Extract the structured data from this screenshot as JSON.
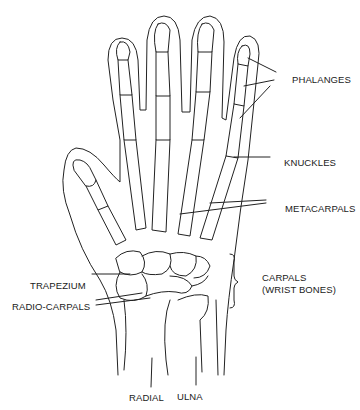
{
  "diagram": {
    "labels": {
      "phalanges": "PHALANGES",
      "knuckles": "KNUCKLES",
      "metacarpals": "METACARPALS",
      "carpals_line1": "CARPALS",
      "carpals_line2": "(WRIST BONES)",
      "trapezium": "TRAPEZIUM",
      "radio_carpals": "RADIO-CARPALS",
      "radial": "RADIAL",
      "ulna": "ULNA"
    },
    "colors": {
      "line": "#222222",
      "text": "#1a1a1a",
      "background": "#ffffff"
    }
  }
}
